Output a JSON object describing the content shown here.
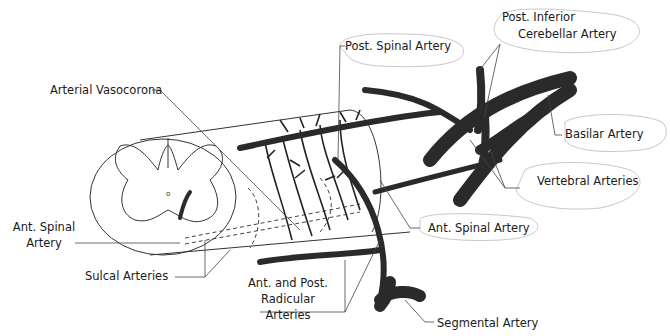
{
  "diagram": {
    "colors": {
      "vessel": "#2a2a2a",
      "outline": "#333333",
      "leader": "#444444",
      "bubble": "#c8c8c8"
    },
    "labels": {
      "post_inferior_cerebellar_1": "Post. Inferior",
      "post_inferior_cerebellar_2": "Cerebellar Artery",
      "post_spinal_artery": "Post. Spinal Artery",
      "arterial_vasocorona": "Arterial Vasocorona",
      "basilar_artery": "Basilar Artery",
      "vertebral_arteries": "Vertebral Arteries",
      "ant_spinal_artery_left_1": "Ant. Spinal",
      "ant_spinal_artery_left_2": "Artery",
      "ant_spinal_artery_right": "Ant. Spinal Artery",
      "sulcal_arteries": "Sulcal Arteries",
      "radicular_1": "Ant. and Post.",
      "radicular_2": "Radicular",
      "radicular_3": "Arteries",
      "segmental_artery": "Segmental Artery",
      "central_canal_mark": "o"
    }
  }
}
